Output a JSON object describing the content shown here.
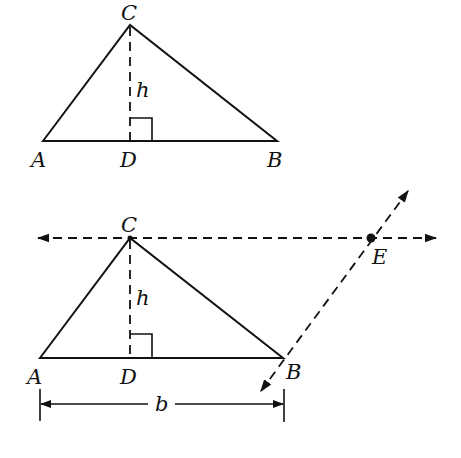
{
  "figure_top": {
    "labels": {
      "C": "C",
      "h": "h",
      "A": "A",
      "D": "D",
      "B": "B"
    }
  },
  "figure_bottom": {
    "labels": {
      "C": "C",
      "h": "h",
      "A": "A",
      "D": "D",
      "B": "B",
      "E": "E",
      "b": "b"
    }
  },
  "colors": {
    "ink": "#111111",
    "background": "#ffffff"
  }
}
